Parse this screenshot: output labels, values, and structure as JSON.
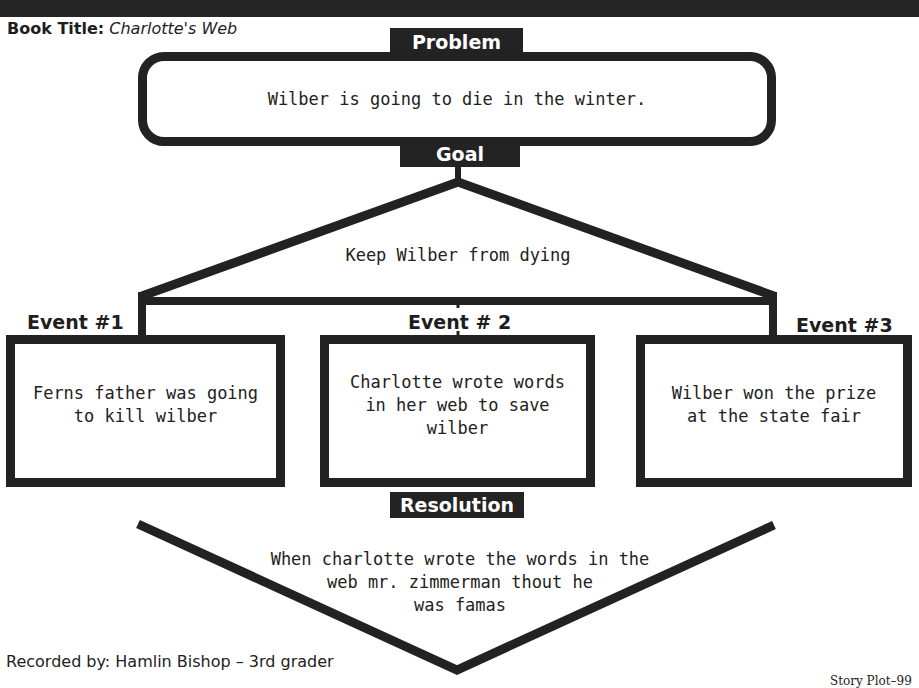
{
  "header": {
    "book_title_label": "Book Title:",
    "book_title_value": "Charlotte's Web"
  },
  "problem": {
    "label": "Problem",
    "text": "Wilber is going to die in the winter."
  },
  "goal": {
    "label": "Goal",
    "text": "Keep Wilber from dying"
  },
  "events": [
    {
      "title": "Event #1",
      "lines": [
        "Ferns father was going",
        "to kill wilber"
      ]
    },
    {
      "title": "Event # 2",
      "lines": [
        "Charlotte wrote words",
        "in her web to save",
        "wilber"
      ]
    },
    {
      "title": "Event #3",
      "lines": [
        "Wilber won the prize",
        "at the state fair"
      ]
    }
  ],
  "resolution": {
    "label": "Resolution",
    "lines": [
      "When charlotte wrote the words in the",
      "web mr. zimmerman thout he",
      "was famas"
    ]
  },
  "footer": {
    "recorded_by": "Recorded by: Hamlin Bishop – 3rd grader",
    "page_label": "Story Plot–99"
  },
  "colors": {
    "ink": "#222222",
    "label_bg": "#232323",
    "label_text": "#ffffff",
    "paper": "#ffffff"
  }
}
